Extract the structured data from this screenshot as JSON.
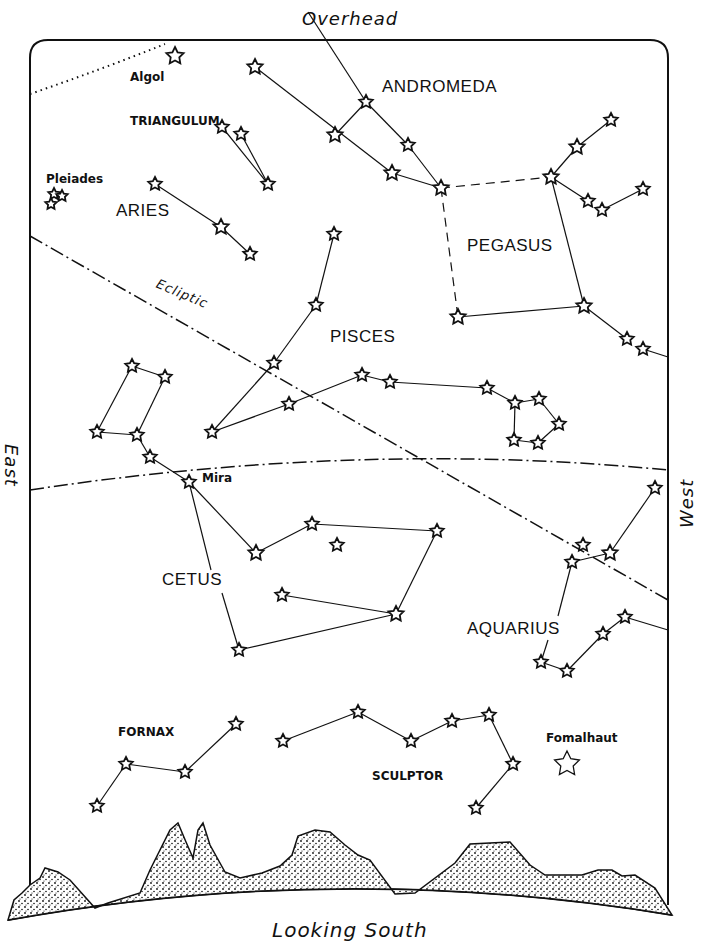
{
  "title": "Looking South",
  "directions": {
    "top": "Overhead",
    "bottom": "Looking South",
    "left": "East",
    "right": "West"
  },
  "ecliptic_label": "Ecliptic",
  "constellations": [
    {
      "name": "ANDROMEDA",
      "x": 408,
      "y": 77
    },
    {
      "name": "TRIANGULUM",
      "x": 130,
      "y": 115
    },
    {
      "name": "ARIES",
      "x": 116,
      "y": 201
    },
    {
      "name": "PEGASUS",
      "x": 467,
      "y": 236
    },
    {
      "name": "PISCES",
      "x": 330,
      "y": 327
    },
    {
      "name": "CETUS",
      "x": 162,
      "y": 570
    },
    {
      "name": "AQUARIUS",
      "x": 467,
      "y": 619
    },
    {
      "name": "FORNAX",
      "x": 118,
      "y": 723
    },
    {
      "name": "SCULPTOR",
      "x": 372,
      "y": 764
    }
  ],
  "named_stars": [
    {
      "name": "Algol",
      "x": 130,
      "y": 70
    },
    {
      "name": "Pleiades",
      "x": 46,
      "y": 172
    },
    {
      "name": "Mira",
      "x": 202,
      "y": 471
    },
    {
      "name": "Fomalhaut",
      "x": 546,
      "y": 733
    }
  ],
  "stars": [
    [
      175,
      56,
      9
    ],
    [
      255,
      67,
      8
    ],
    [
      335,
      135,
      8
    ],
    [
      366,
      102,
      7
    ],
    [
      408,
      145,
      7
    ],
    [
      392,
      173,
      8
    ],
    [
      441,
      188,
      8
    ],
    [
      551,
      177,
      8
    ],
    [
      577,
      147,
      8
    ],
    [
      611,
      120,
      7
    ],
    [
      588,
      201,
      7
    ],
    [
      602,
      210,
      7
    ],
    [
      643,
      189,
      7
    ],
    [
      458,
      317,
      8
    ],
    [
      584,
      306,
      8
    ],
    [
      627,
      339,
      7
    ],
    [
      643,
      349,
      7
    ],
    [
      222,
      127,
      7
    ],
    [
      241,
      134,
      7
    ],
    [
      268,
      184,
      7
    ],
    [
      155,
      184,
      7
    ],
    [
      221,
      227,
      8
    ],
    [
      250,
      254,
      7
    ],
    [
      334,
      234,
      7
    ],
    [
      316,
      305,
      7
    ],
    [
      274,
      363,
      7
    ],
    [
      289,
      404,
      7
    ],
    [
      212,
      432,
      7
    ],
    [
      362,
      375,
      7
    ],
    [
      390,
      382,
      7
    ],
    [
      487,
      388,
      7
    ],
    [
      515,
      403,
      7
    ],
    [
      539,
      399,
      7
    ],
    [
      559,
      424,
      7
    ],
    [
      514,
      440,
      7
    ],
    [
      538,
      443,
      7
    ],
    [
      132,
      366,
      7
    ],
    [
      165,
      377,
      7
    ],
    [
      97,
      432,
      7
    ],
    [
      137,
      435,
      7
    ],
    [
      150,
      457,
      7
    ],
    [
      189,
      482,
      7
    ],
    [
      256,
      553,
      8
    ],
    [
      312,
      524,
      7
    ],
    [
      337,
      545,
      7
    ],
    [
      437,
      531,
      7
    ],
    [
      282,
      595,
      7
    ],
    [
      396,
      614,
      8
    ],
    [
      239,
      650,
      7
    ],
    [
      655,
      488,
      7
    ],
    [
      610,
      553,
      8
    ],
    [
      572,
      562,
      7
    ],
    [
      583,
      545,
      7
    ],
    [
      625,
      617,
      7
    ],
    [
      603,
      634,
      7
    ],
    [
      541,
      662,
      7
    ],
    [
      567,
      671,
      7
    ],
    [
      236,
      724,
      7
    ],
    [
      185,
      772,
      7
    ],
    [
      126,
      764,
      7
    ],
    [
      97,
      806,
      7
    ],
    [
      283,
      741,
      7
    ],
    [
      358,
      712,
      7
    ],
    [
      411,
      741,
      7
    ],
    [
      452,
      721,
      7
    ],
    [
      489,
      715,
      7
    ],
    [
      513,
      764,
      7
    ],
    [
      476,
      808,
      7
    ],
    [
      54,
      194,
      6
    ],
    [
      62,
      196,
      6
    ],
    [
      51,
      204,
      6
    ]
  ],
  "fomalhaut_star": [
    567,
    764,
    13
  ],
  "lines": [
    [
      [
        255,
        67
      ],
      [
        392,
        173
      ]
    ],
    [
      [
        392,
        173
      ],
      [
        441,
        188
      ]
    ],
    [
      [
        335,
        135
      ],
      [
        366,
        102
      ]
    ],
    [
      [
        308,
        12
      ],
      [
        366,
        102
      ]
    ],
    [
      [
        366,
        102
      ],
      [
        408,
        145
      ]
    ],
    [
      [
        408,
        145
      ],
      [
        441,
        188
      ]
    ],
    [
      [
        551,
        177
      ],
      [
        577,
        147
      ]
    ],
    [
      [
        577,
        147
      ],
      [
        611,
        120
      ]
    ],
    [
      [
        551,
        177
      ],
      [
        588,
        201
      ]
    ],
    [
      [
        602,
        210
      ],
      [
        643,
        189
      ]
    ],
    [
      [
        551,
        177
      ],
      [
        584,
        306
      ]
    ],
    [
      [
        458,
        317
      ],
      [
        584,
        306
      ]
    ],
    [
      [
        584,
        306
      ],
      [
        627,
        339
      ]
    ],
    [
      [
        643,
        349
      ],
      [
        668,
        357
      ]
    ],
    [
      [
        222,
        127
      ],
      [
        268,
        184
      ]
    ],
    [
      [
        241,
        134
      ],
      [
        268,
        184
      ]
    ],
    [
      [
        155,
        184
      ],
      [
        221,
        227
      ]
    ],
    [
      [
        221,
        227
      ],
      [
        250,
        254
      ]
    ],
    [
      [
        334,
        234
      ],
      [
        316,
        305
      ]
    ],
    [
      [
        316,
        305
      ],
      [
        274,
        363
      ]
    ],
    [
      [
        274,
        363
      ],
      [
        212,
        432
      ]
    ],
    [
      [
        212,
        432
      ],
      [
        289,
        404
      ]
    ],
    [
      [
        289,
        404
      ],
      [
        362,
        375
      ]
    ],
    [
      [
        362,
        375
      ],
      [
        390,
        382
      ]
    ],
    [
      [
        390,
        382
      ],
      [
        487,
        388
      ]
    ],
    [
      [
        487,
        388
      ],
      [
        515,
        403
      ]
    ],
    [
      [
        515,
        403
      ],
      [
        539,
        399
      ]
    ],
    [
      [
        539,
        399
      ],
      [
        559,
        424
      ]
    ],
    [
      [
        559,
        424
      ],
      [
        538,
        443
      ]
    ],
    [
      [
        538,
        443
      ],
      [
        514,
        440
      ]
    ],
    [
      [
        514,
        440
      ],
      [
        515,
        403
      ]
    ],
    [
      [
        132,
        366
      ],
      [
        165,
        377
      ]
    ],
    [
      [
        132,
        366
      ],
      [
        97,
        432
      ]
    ],
    [
      [
        165,
        377
      ],
      [
        137,
        435
      ]
    ],
    [
      [
        97,
        432
      ],
      [
        137,
        435
      ]
    ],
    [
      [
        137,
        435
      ],
      [
        150,
        457
      ]
    ],
    [
      [
        150,
        457
      ],
      [
        189,
        482
      ]
    ],
    [
      [
        189,
        482
      ],
      [
        256,
        553
      ]
    ],
    [
      [
        256,
        553
      ],
      [
        312,
        524
      ]
    ],
    [
      [
        312,
        524
      ],
      [
        437,
        531
      ]
    ],
    [
      [
        437,
        531
      ],
      [
        396,
        614
      ]
    ],
    [
      [
        282,
        595
      ],
      [
        396,
        614
      ]
    ],
    [
      [
        396,
        614
      ],
      [
        239,
        650
      ]
    ],
    [
      [
        189,
        482
      ],
      [
        211,
        570
      ]
    ],
    [
      [
        222,
        593
      ],
      [
        239,
        650
      ]
    ],
    [
      [
        655,
        488
      ],
      [
        610,
        553
      ]
    ],
    [
      [
        610,
        553
      ],
      [
        572,
        562
      ]
    ],
    [
      [
        572,
        562
      ],
      [
        558,
        616
      ]
    ],
    [
      [
        548,
        640
      ],
      [
        541,
        662
      ]
    ],
    [
      [
        541,
        662
      ],
      [
        567,
        671
      ]
    ],
    [
      [
        567,
        671
      ],
      [
        603,
        634
      ]
    ],
    [
      [
        603,
        634
      ],
      [
        625,
        617
      ]
    ],
    [
      [
        625,
        617
      ],
      [
        668,
        630
      ]
    ],
    [
      [
        236,
        724
      ],
      [
        185,
        772
      ]
    ],
    [
      [
        185,
        772
      ],
      [
        126,
        764
      ]
    ],
    [
      [
        126,
        764
      ],
      [
        97,
        806
      ]
    ],
    [
      [
        283,
        741
      ],
      [
        358,
        712
      ]
    ],
    [
      [
        358,
        712
      ],
      [
        411,
        741
      ]
    ],
    [
      [
        411,
        741
      ],
      [
        452,
        721
      ]
    ],
    [
      [
        452,
        721
      ],
      [
        489,
        715
      ]
    ],
    [
      [
        489,
        715
      ],
      [
        513,
        764
      ]
    ],
    [
      [
        513,
        764
      ],
      [
        476,
        808
      ]
    ]
  ],
  "dashed_lines": [
    [
      [
        441,
        188
      ],
      [
        551,
        177
      ]
    ],
    [
      [
        441,
        188
      ],
      [
        458,
        317
      ]
    ]
  ],
  "ecliptic": [
    [
      30,
      236
    ],
    [
      668,
      600
    ]
  ],
  "equator": "M 30 490 Q 360 440 668 470"
}
